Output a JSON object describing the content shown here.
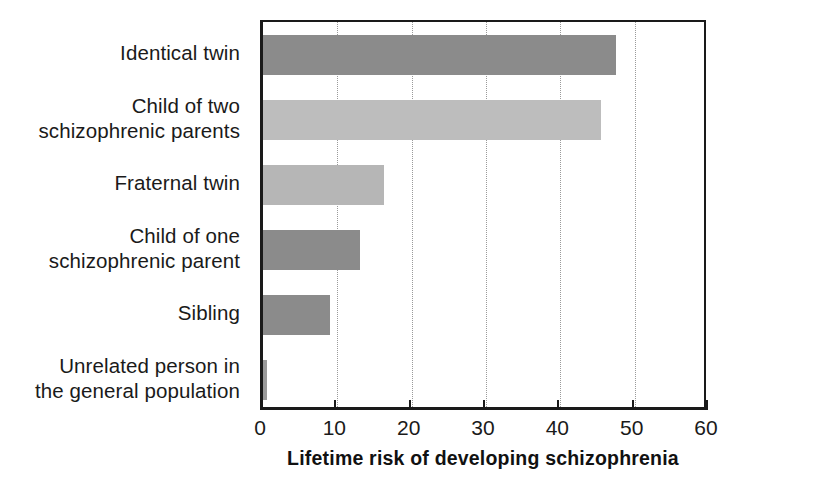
{
  "chart_data": {
    "type": "bar",
    "orientation": "horizontal",
    "title": "",
    "xlabel": "Lifetime risk of developing schizophrenia",
    "ylabel": "",
    "xlim": [
      0,
      60
    ],
    "ylim": null,
    "grid": true,
    "legend": false,
    "xticks": [
      "0",
      "10",
      "20",
      "30",
      "40",
      "50",
      "60"
    ],
    "xtick_values": [
      0,
      10,
      20,
      30,
      40,
      50,
      60
    ],
    "categories": [
      "Identical twin",
      "Child of two\nschizophrenic parents",
      "Fraternal twin",
      "Child of one\nschizophrenic parent",
      "Sibling",
      "Unrelated person in\nthe general population"
    ],
    "values": [
      47.5,
      45.5,
      16.3,
      13,
      9,
      0.5
    ],
    "bar_colors": [
      "#8b8b8b",
      "#bdbdbd",
      "#b6b6b6",
      "#8b8b8b",
      "#8b8b8b",
      "#9a9a9a"
    ]
  },
  "colors": {
    "axis": "#1a1a1a",
    "grid": "#9a9a9a",
    "background": "#ffffff",
    "bar_dark": "#8b8b8b",
    "bar_light": "#bdbdbd"
  }
}
